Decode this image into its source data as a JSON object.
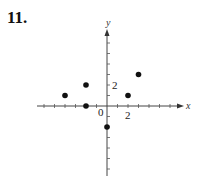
{
  "problem_number": "11.",
  "chart_data": {
    "type": "scatter",
    "title": "",
    "xlabel": "x",
    "ylabel": "y",
    "xlim": [
      -6,
      7
    ],
    "ylim": [
      -6,
      7
    ],
    "grid": false,
    "tick_labels": {
      "x": [
        "0",
        "2"
      ],
      "y": [
        "2"
      ]
    },
    "points": [
      {
        "x": -4,
        "y": 1
      },
      {
        "x": -2,
        "y": 2
      },
      {
        "x": -2,
        "y": 0
      },
      {
        "x": 0,
        "y": -2
      },
      {
        "x": 2,
        "y": 1
      },
      {
        "x": 3,
        "y": 3
      }
    ]
  }
}
